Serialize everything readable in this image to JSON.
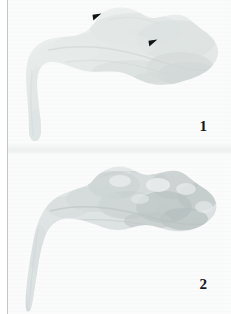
{
  "figure": {
    "type": "two-panel-specimen-micrograph",
    "panel_count": 2,
    "background_color": "#ffffff",
    "paper_tone_color": "#f6f7f7",
    "left_rule_color": "#b9bcbe"
  },
  "panels": [
    {
      "number": "1",
      "number_position": "bottom-right",
      "specimen_description": "pale flattened tissue specimen with smooth undulating upper contour and a hooked tapering tail descending at the left",
      "tissue_tone": "#e8ebea",
      "tissue_tone_mid": "#dfe3e2",
      "tissue_tone_dark": "#d2d7d6",
      "texture": "halftone-dot-screen",
      "annotations": [
        {
          "kind": "arrowhead",
          "label": "arrowhead-upper-left",
          "direction": "down-right",
          "color": "#111315",
          "x": 85,
          "y": 14
        },
        {
          "kind": "arrowhead",
          "label": "arrowhead-center-right",
          "direction": "down-right",
          "color": "#111315",
          "x": 141,
          "y": 40
        }
      ]
    },
    {
      "number": "2",
      "number_position": "bottom-right",
      "specimen_description": "similar specimen shown with coarser nodular lobulated surface, darker mottled shading and a slender tapering tail at the left",
      "tissue_tone": "#dfe3e3",
      "tissue_tone_mid": "#cdd3d3",
      "tissue_tone_dark": "#b3bbbb",
      "texture": "halftone-dot-screen",
      "annotations": []
    }
  ]
}
